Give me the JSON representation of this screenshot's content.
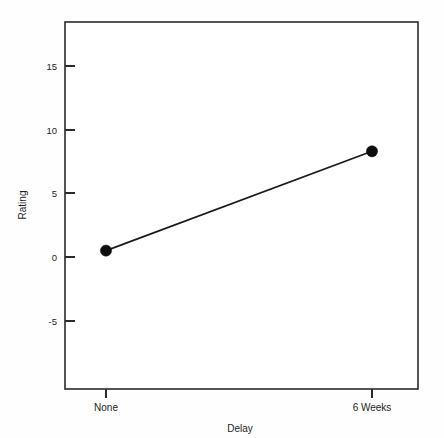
{
  "chart_data": {
    "type": "line",
    "title": "",
    "xlabel": "Delay",
    "ylabel": "Rating",
    "categories": [
      "None",
      "6 Weeks"
    ],
    "values": [
      0.5,
      8.3
    ],
    "series": [
      {
        "name": "Rating",
        "values": [
          0.5,
          8.3
        ]
      }
    ],
    "yticks": [
      15,
      10,
      5,
      0,
      -5
    ],
    "ytick_labels": [
      "15",
      "10",
      "5",
      "0",
      "-5"
    ],
    "xtick_labels": [
      "None",
      "6 Weeks"
    ],
    "ylim": [
      -8.5,
      17.5
    ],
    "xlim": [
      0,
      1
    ],
    "grid": false,
    "legend": false,
    "marker": "filled-circle",
    "line_color": "#1a1a1a",
    "marker_color": "#0d0d0d",
    "axis_color": "#2b2b2b",
    "background_color": "#ffffff"
  },
  "figure": {
    "y_axis_title": "Rating",
    "x_axis_title": "Delay"
  }
}
